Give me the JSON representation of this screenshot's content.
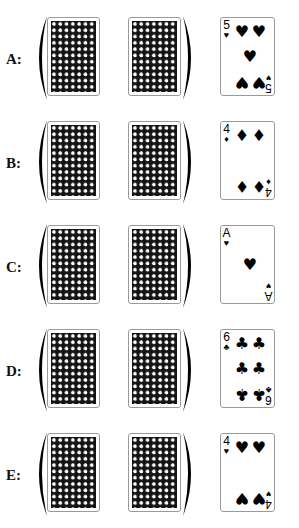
{
  "question_header_partial": "",
  "options": [
    {
      "label": "A:",
      "face_card": {
        "rank": "5",
        "suit": "hearts",
        "suit_symbol": "♥",
        "pips": [
          {
            "x": 13,
            "y": 6,
            "inv": false
          },
          {
            "x": 30,
            "y": 6,
            "inv": false
          },
          {
            "x": 21,
            "y": 31,
            "inv": false
          },
          {
            "x": 13,
            "y": 56,
            "inv": true
          },
          {
            "x": 30,
            "y": 56,
            "inv": true
          }
        ]
      }
    },
    {
      "label": "B:",
      "face_card": {
        "rank": "4",
        "suit": "diamonds",
        "suit_symbol": "♦",
        "pips": [
          {
            "x": 13,
            "y": 6,
            "inv": false
          },
          {
            "x": 30,
            "y": 6,
            "inv": false
          },
          {
            "x": 13,
            "y": 56,
            "inv": true
          },
          {
            "x": 30,
            "y": 56,
            "inv": true
          }
        ]
      }
    },
    {
      "label": "C:",
      "face_card": {
        "rank": "A",
        "suit": "hearts",
        "suit_symbol": "♥",
        "pips": [
          {
            "x": 21,
            "y": 31,
            "inv": false
          }
        ]
      }
    },
    {
      "label": "D:",
      "face_card": {
        "rank": "6",
        "suit": "clubs",
        "suit_symbol": "♣",
        "pips": [
          {
            "x": 13,
            "y": 6,
            "inv": false
          },
          {
            "x": 30,
            "y": 6,
            "inv": false
          },
          {
            "x": 13,
            "y": 31,
            "inv": false
          },
          {
            "x": 30,
            "y": 31,
            "inv": false
          },
          {
            "x": 13,
            "y": 56,
            "inv": true
          },
          {
            "x": 30,
            "y": 56,
            "inv": true
          }
        ]
      }
    },
    {
      "label": "E:",
      "face_card": {
        "rank": "4",
        "suit": "hearts",
        "suit_symbol": "♥",
        "pips": [
          {
            "x": 13,
            "y": 6,
            "inv": false
          },
          {
            "x": 30,
            "y": 6,
            "inv": false
          },
          {
            "x": 13,
            "y": 56,
            "inv": true
          },
          {
            "x": 30,
            "y": 56,
            "inv": true
          }
        ]
      }
    }
  ],
  "card_back": {
    "icon": "card-back-pattern",
    "color": "#141414",
    "dot_color": "#ffffff"
  },
  "colors": {
    "ink": "#000000",
    "border": "#9a9a9a",
    "background": "#ffffff"
  }
}
